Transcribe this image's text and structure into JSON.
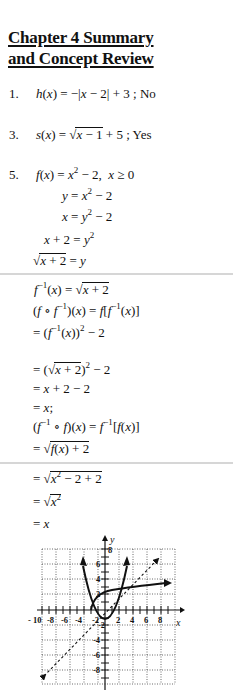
{
  "title": {
    "line1": "Chapter 4 Summary",
    "line2": "and Concept Review"
  },
  "problems": [
    {
      "number": "1.",
      "text": "h(x) = −|x − 2| + 3 ; No"
    },
    {
      "number": "3.",
      "text": "s(x) = √(x − 1) + 5 ; Yes"
    },
    {
      "number": "5.",
      "text": "f(x) = x² − 2,  x ≥ 0"
    }
  ],
  "steps": [
    "y = x² − 2",
    "x = y² − 2",
    "x + 2 = y²",
    "√(x + 2) = y",
    "f⁻¹(x) = √(x + 2)",
    "(f ∘ f⁻¹)(x) = f[f⁻¹(x)]",
    "= (f⁻¹(x))² − 2",
    "= (√(x + 2))² − 2",
    "= x + 2 − 2",
    "= x;",
    "(f⁻¹ ∘ f)(x) = f⁻¹[f(x)]",
    "= √(f(x) + 2)",
    "= √(x² − 2 + 2)",
    "= √(x²)",
    "= x"
  ],
  "graph": {
    "x_label": "x",
    "y_label": "y",
    "x_ticks": [
      "-10",
      "-8",
      "-6",
      "-4",
      "-2",
      "2",
      "4",
      "6",
      "8"
    ],
    "y_ticks": [
      "8",
      "6",
      "4",
      "2",
      "-2",
      "-4",
      "-6",
      "-8"
    ],
    "curves": [
      "f(x) = x² − 2",
      "f⁻¹(x) = √(x + 2)",
      "y = x (dashed)"
    ]
  }
}
